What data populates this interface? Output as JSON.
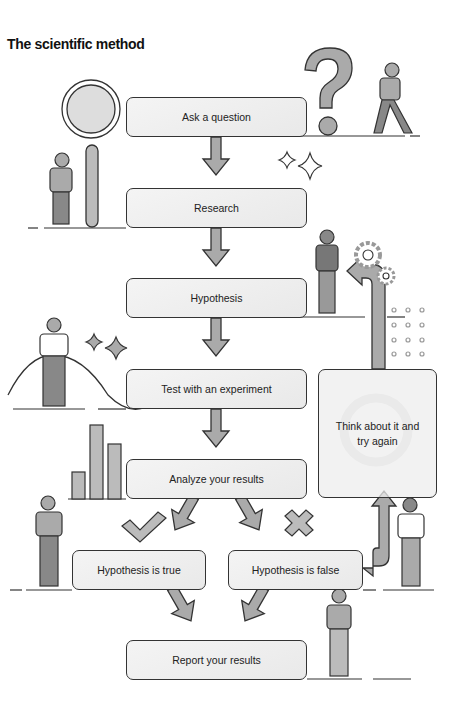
{
  "title": "The scientific method",
  "steps": {
    "ask": "Ask a question",
    "research": "Research",
    "hypothesis": "Hypothesis",
    "test": "Test with an experiment",
    "analyze": "Analyze your results",
    "true": "Hypothesis is true",
    "false": "Hypothesis is false",
    "think": "Think about it and try again",
    "report": "Report your results"
  },
  "colors": {
    "fill": "#aaaaaa",
    "stroke": "#333333",
    "box": "#eeeeee"
  }
}
